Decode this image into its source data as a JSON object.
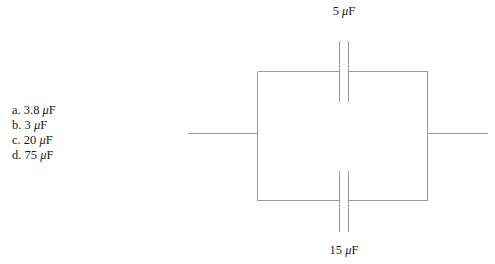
{
  "page": {
    "background_color": "#ffffff",
    "width": 495,
    "height": 264,
    "clipped_top_text": "."
  },
  "question": {
    "answers": [
      {
        "id": "a",
        "prefix": "a.",
        "value": "3.8",
        "mu": "μ",
        "unit": "F",
        "full": "a. 3.8 μF"
      },
      {
        "id": "b",
        "prefix": "b.",
        "value": "3",
        "mu": "μ",
        "unit": "F",
        "full": "b. 3 μF"
      },
      {
        "id": "c",
        "prefix": "c.",
        "value": "20",
        "mu": "μ",
        "unit": "F",
        "full": "c. 20 μF"
      },
      {
        "id": "d",
        "prefix": "d.",
        "value": "75",
        "mu": "μ",
        "unit": "F",
        "full": "d. 75 μF"
      }
    ]
  },
  "diagram": {
    "type": "circuit-schematic",
    "line_color": "#9a9a9a",
    "line_width": 1,
    "labels": {
      "top_capacitor": "5 μF",
      "top_capacitor_value": "5",
      "top_capacitor_mu": "μ",
      "top_capacitor_unit": "F",
      "bottom_capacitor": "15 μF",
      "bottom_capacitor_value": "15",
      "bottom_capacitor_mu": "μ",
      "bottom_capacitor_unit": "F"
    },
    "geometry": {
      "loop_left_x": 257,
      "loop_right_x": 427,
      "loop_top_y": 71,
      "loop_bottom_y": 200,
      "gap_left_x": 339,
      "gap_right_x": 348,
      "plate_top_y": 40,
      "plate_bottom_y": 231,
      "lead_y": 133,
      "lead_left_start_x": 187,
      "lead_right_end_x": 487
    }
  }
}
